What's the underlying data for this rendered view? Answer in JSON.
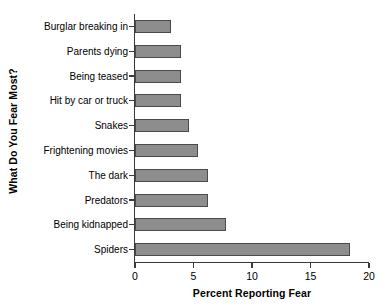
{
  "chart_data": {
    "type": "bar",
    "orientation": "horizontal",
    "title": "",
    "xlabel": "Percent Reporting Fear",
    "ylabel": "What Do You Fear Most?",
    "xlim": [
      0,
      20
    ],
    "xticks": [
      0,
      5,
      10,
      15,
      20
    ],
    "xtick_labels": [
      "0",
      "5",
      "10",
      "15",
      "20"
    ],
    "grid": false,
    "legend": false,
    "bar_color": "#8d8d8d",
    "bar_edge_color": "#4a4a4a",
    "axis_color": "#3a3a3a",
    "categories": [
      "Burglar breaking in",
      "Parents dying",
      "Being teased",
      "Hit by car or truck",
      "Snakes",
      "Frightening movies",
      "The dark",
      "Predators",
      "Being kidnapped",
      "Spiders"
    ],
    "values": [
      3.1,
      3.9,
      3.9,
      3.9,
      4.6,
      5.4,
      6.2,
      6.2,
      7.8,
      18.4
    ]
  }
}
